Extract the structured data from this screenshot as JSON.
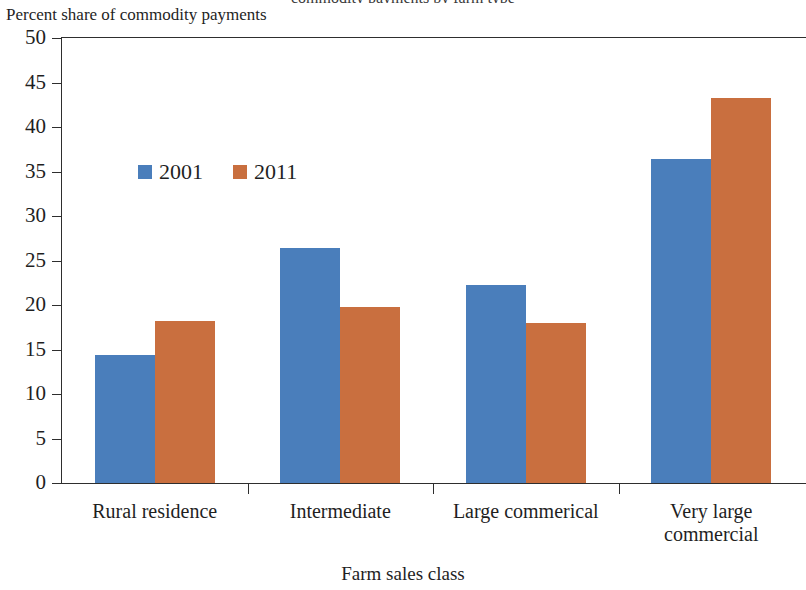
{
  "chart_data": {
    "type": "bar",
    "title": "commodity payments by farm type",
    "title_truncated": true,
    "ylabel": "Percent share of commodity payments",
    "xlabel": "Farm sales class",
    "categories": [
      "Rural residence",
      "Intermediate",
      "Large commerical",
      "Very large commercial"
    ],
    "categories_wrapped": [
      [
        "Rural residence"
      ],
      [
        "Intermediate"
      ],
      [
        "Large commerical"
      ],
      [
        "Very large",
        "commercial"
      ]
    ],
    "series": [
      {
        "name": "2001",
        "color": "#4a7ebb",
        "values": [
          14.4,
          26.4,
          22.2,
          36.4
        ]
      },
      {
        "name": "2011",
        "color": "#c96f3f",
        "values": [
          18.2,
          19.8,
          18.0,
          43.3
        ]
      }
    ],
    "ylim": [
      0,
      50
    ],
    "ytick_step": 5,
    "yticks": [
      50,
      45,
      40,
      35,
      30,
      25,
      20,
      15,
      10,
      5,
      0
    ],
    "ytick_labels": [
      "50",
      "45",
      "40",
      "35",
      "30",
      "25",
      "20",
      "15",
      "10",
      "5",
      "0"
    ],
    "grid": false,
    "legend_position": "inside-upper-left"
  },
  "colors": {
    "series_2001": "#4a7ebb",
    "series_2011": "#c96f3f",
    "axis": "#2e2e2e",
    "text": "#1f1f1f",
    "background": "#ffffff"
  }
}
